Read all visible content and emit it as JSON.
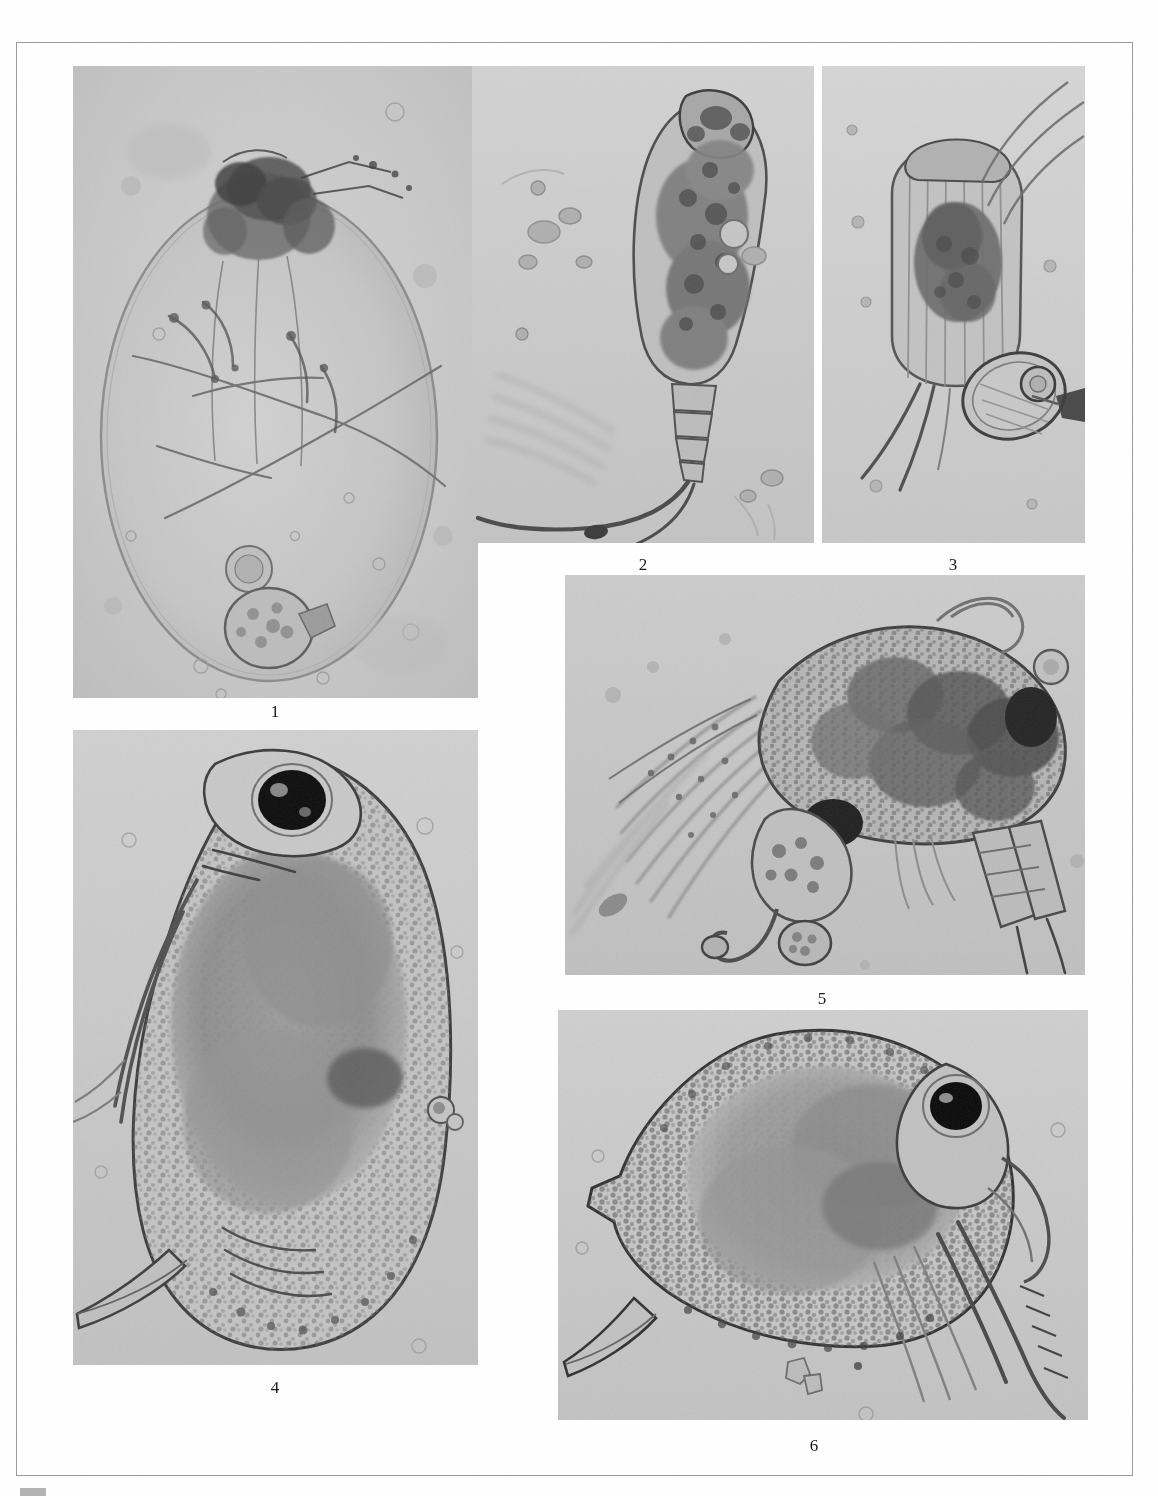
{
  "plate": {
    "title": "Photomicrograph plate of planktonic microcrustaceans and rotifers",
    "background_color": "#ffffff",
    "frame_color": "#9a9a9a",
    "panel_background": "#c9c9c9",
    "label_color": "#1a1a1a",
    "panel_count": 6,
    "rendering": "grayscale light-microscope photomicrographs"
  },
  "panels": [
    {
      "id": "panel-1",
      "label": "1",
      "subject": "ovoid transparent organism with dark apical mass, internal filaments and a round embryo near base",
      "x": 73,
      "y": 66,
      "width": 405,
      "height": 632,
      "label_x": 275,
      "label_y": 703,
      "tone": {
        "base": "#c6c6c6",
        "highlight": "#e6e6e6",
        "shadow": "#4a4a4a"
      }
    },
    {
      "id": "panel-2",
      "label": "2",
      "subject": "elongate copepod-like body with granular interior and long trailing caudal seta",
      "x": 472,
      "y": 66,
      "width": 342,
      "height": 477,
      "label_x": 643,
      "label_y": 556,
      "tone": {
        "base": "#cbcbcb",
        "highlight": "#e8e8e8",
        "shadow": "#3c3c3c"
      }
    },
    {
      "id": "panel-3",
      "label": "3",
      "subject": "loricate rotifer with dark gut mass, attached spherical egg and radiating bristles",
      "x": 822,
      "y": 66,
      "width": 263,
      "height": 477,
      "label_x": 953,
      "label_y": 556,
      "tone": {
        "base": "#cdcdcd",
        "highlight": "#ececec",
        "shadow": "#3a3a3a"
      }
    },
    {
      "id": "panel-4",
      "label": "4",
      "subject": "cladoceran with large black compound eye, granular carapace and ventral spine",
      "x": 73,
      "y": 730,
      "width": 405,
      "height": 635,
      "label_x": 275,
      "label_y": 1379,
      "tone": {
        "base": "#c8c8c8",
        "highlight": "#e4e4e4",
        "shadow": "#2e2e2e"
      }
    },
    {
      "id": "panel-5",
      "label": "5",
      "subject": "copepod anterior with plumose feathered setae, dark eye spot and segmented appendages",
      "x": 565,
      "y": 575,
      "width": 520,
      "height": 400,
      "label_x": 822,
      "label_y": 990,
      "tone": {
        "base": "#c4c4c4",
        "highlight": "#e2e2e2",
        "shadow": "#2a2a2a"
      }
    },
    {
      "id": "panel-6",
      "label": "6",
      "subject": "cladoceran in lateral view with black eye, reticulate carapace, posterior spine and antennal setae",
      "x": 558,
      "y": 1010,
      "width": 530,
      "height": 410,
      "label_x": 814,
      "label_y": 1437,
      "tone": {
        "base": "#cacaca",
        "highlight": "#e9e9e9",
        "shadow": "#2c2c2c"
      }
    }
  ],
  "caption": {
    "visible_fragment": "",
    "note": "caption text cropped off at the bottom edge of the page"
  }
}
